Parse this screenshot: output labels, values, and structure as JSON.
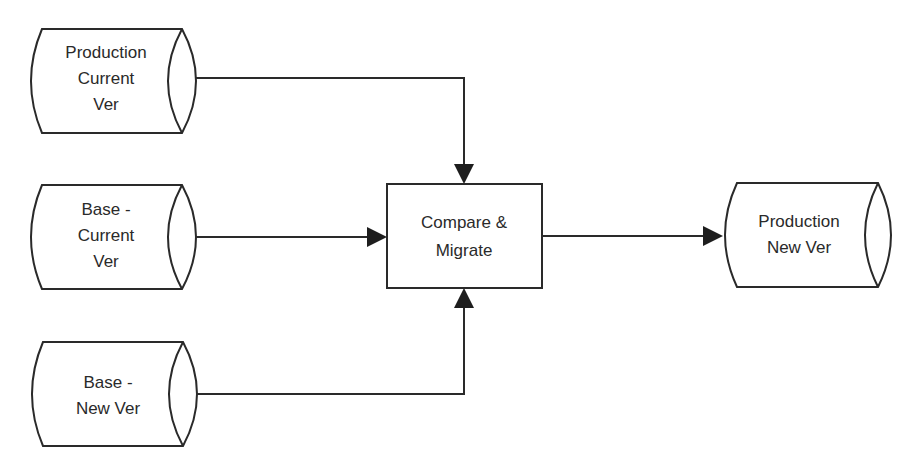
{
  "diagram": {
    "type": "flowchart",
    "nodes": [
      {
        "id": "prod_current",
        "shape": "stored-data",
        "lines": [
          "Production",
          "Current",
          "Ver"
        ]
      },
      {
        "id": "base_current",
        "shape": "stored-data",
        "lines": [
          "Base -",
          "Current",
          "Ver"
        ]
      },
      {
        "id": "base_new",
        "shape": "stored-data",
        "lines": [
          "Base -",
          "New Ver"
        ]
      },
      {
        "id": "compare_migrate",
        "shape": "process",
        "lines": [
          "Compare &",
          "Migrate"
        ]
      },
      {
        "id": "prod_new",
        "shape": "stored-data",
        "lines": [
          "Production",
          "New Ver"
        ]
      }
    ],
    "edges": [
      {
        "from": "prod_current",
        "to": "compare_migrate",
        "enters": "top"
      },
      {
        "from": "base_current",
        "to": "compare_migrate",
        "enters": "left"
      },
      {
        "from": "base_new",
        "to": "compare_migrate",
        "enters": "bottom"
      },
      {
        "from": "compare_migrate",
        "to": "prod_new",
        "enters": "left"
      }
    ]
  }
}
